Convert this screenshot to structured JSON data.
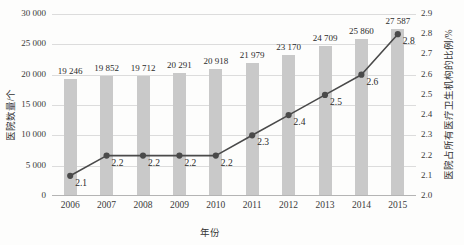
{
  "chart_data": {
    "type": "bar",
    "title": "",
    "xlabel": "年份",
    "ylabel": "医院数量/个",
    "y2label": "医院占所有医疗卫生机构的比例/%",
    "categories": [
      "2006",
      "2007",
      "2008",
      "2009",
      "2010",
      "2011",
      "2012",
      "2013",
      "2014",
      "2015"
    ],
    "series": [
      {
        "name": "医院数量/个",
        "type": "bar",
        "axis": "left",
        "values": [
          19246,
          19852,
          19712,
          20291,
          20918,
          21979,
          23170,
          24709,
          25860,
          27587
        ],
        "labels": [
          "19 246",
          "19 852",
          "19 712",
          "20 291",
          "20 918",
          "21 979",
          "23 170",
          "24 709",
          "25 860",
          "27 587"
        ],
        "color": "#c9c9c9"
      },
      {
        "name": "医院占所有医疗卫生机构的比例/%",
        "type": "line",
        "axis": "right",
        "values": [
          2.1,
          2.2,
          2.2,
          2.2,
          2.2,
          2.3,
          2.4,
          2.5,
          2.6,
          2.8
        ],
        "labels": [
          "2.1",
          "2.2",
          "2.2",
          "2.2",
          "2.2",
          "2.3",
          "2.4",
          "2.5",
          "2.6",
          "2.8"
        ],
        "color": "#4a4a4a"
      }
    ],
    "ylim": [
      0,
      30000
    ],
    "yticks": [
      0,
      5000,
      10000,
      15000,
      20000,
      25000,
      30000
    ],
    "ytick_labels": [
      "0",
      "5 000",
      "10 000",
      "15 000",
      "20 000",
      "25 000",
      "30 000"
    ],
    "y2lim": [
      2.0,
      2.9
    ],
    "y2ticks": [
      2.0,
      2.1,
      2.2,
      2.3,
      2.4,
      2.5,
      2.6,
      2.7,
      2.8,
      2.9
    ],
    "y2tick_labels": [
      "2.0",
      "2.1",
      "2.2",
      "2.3",
      "2.4",
      "2.5",
      "2.6",
      "2.7",
      "2.8",
      "2.9"
    ],
    "grid": true,
    "legend": "none"
  }
}
